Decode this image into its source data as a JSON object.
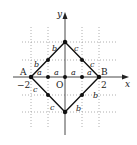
{
  "diagram": {
    "axes": {
      "x_label": "x",
      "y_label": "y",
      "origin_label": "O"
    },
    "points": {
      "A": "A",
      "B": "B"
    },
    "ticks": {
      "neg_two": "−2",
      "two": "2"
    },
    "segment_labels": {
      "a": "a",
      "b": "b",
      "c": "c"
    },
    "grid": {
      "x_range": [
        -2,
        2
      ],
      "y_range": [
        -2,
        2
      ],
      "style": "dotted"
    }
  }
}
